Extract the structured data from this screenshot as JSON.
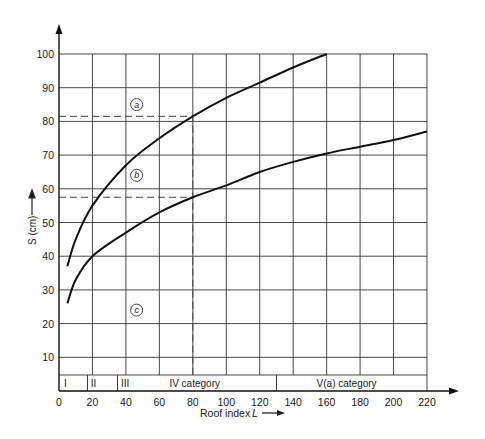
{
  "chart_data": {
    "type": "line",
    "title": "",
    "xlabel": "Roof index L",
    "ylabel": "S (cm)",
    "xlim": [
      0,
      220
    ],
    "ylim": [
      0,
      100
    ],
    "x_ticks": [
      0,
      20,
      40,
      60,
      80,
      100,
      120,
      140,
      160,
      180,
      200,
      220
    ],
    "y_ticks": [
      10,
      20,
      30,
      40,
      50,
      60,
      70,
      80,
      90,
      100
    ],
    "grid": true,
    "series": [
      {
        "name": "a",
        "x": [
          5,
          10,
          20,
          40,
          60,
          80,
          100,
          120,
          140,
          160
        ],
        "values": [
          37,
          45,
          55,
          67,
          75,
          81.5,
          87,
          91.5,
          96,
          100
        ]
      },
      {
        "name": "b",
        "x": [
          5,
          10,
          20,
          40,
          60,
          80,
          100,
          120,
          140,
          160,
          180,
          200,
          220
        ],
        "values": [
          26,
          33,
          40,
          47,
          53,
          57.5,
          61,
          65,
          68,
          70.5,
          72.5,
          74.5,
          77
        ]
      }
    ],
    "region_labels": [
      {
        "label": "a",
        "x": 50,
        "y": 85
      },
      {
        "label": "b",
        "x": 50,
        "y": 64
      },
      {
        "label": "c",
        "x": 50,
        "y": 24
      }
    ],
    "reference_lines": [
      {
        "type": "vertical",
        "x": 80,
        "style": "dashed"
      },
      {
        "type": "horizontal",
        "y": 81.5,
        "x_to": 80,
        "style": "dashed"
      },
      {
        "type": "horizontal",
        "y": 57.5,
        "x_to": 80,
        "style": "dashed"
      }
    ],
    "categories": [
      {
        "label": "I",
        "from": 0,
        "to": 17
      },
      {
        "label": "II",
        "from": 17,
        "to": 35
      },
      {
        "label": "III",
        "from": 35,
        "to": 130
      },
      {
        "label": "IV category",
        "from": 35,
        "to": 130
      },
      {
        "label": "V(a) category",
        "from": 130,
        "to": 220
      }
    ]
  },
  "labels": {
    "ylabel": "S (cm)",
    "xlabel": "Roof index",
    "xlabel_var": "L",
    "cat_I": "I",
    "cat_II": "II",
    "cat_III": "III",
    "cat_IV": "IV category",
    "cat_V": "V(a) category",
    "circle_a": "a",
    "circle_b": "b",
    "circle_c": "c"
  }
}
